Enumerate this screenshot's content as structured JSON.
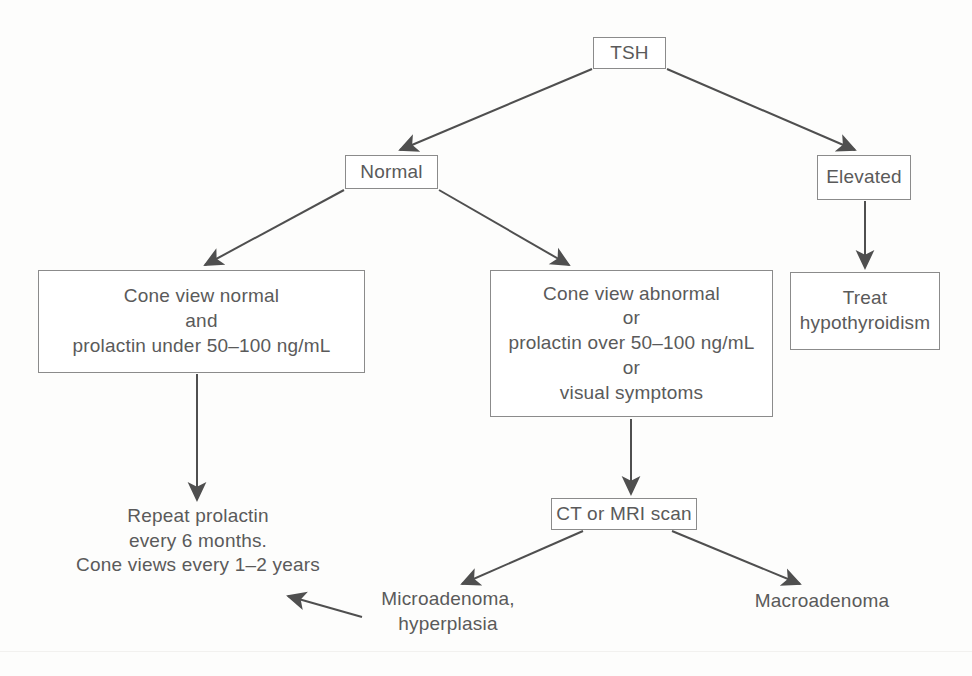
{
  "diagram": {
    "style": {
      "stroke": "#4f4f4f",
      "box_border": "#8b8b8b",
      "text_color": "#5a5a5a",
      "background": "#fdfdfc"
    },
    "nodes": {
      "tsh": {
        "label": "TSH",
        "shape": "box"
      },
      "normal": {
        "label": "Normal",
        "shape": "box"
      },
      "elevated": {
        "label": "Elevated",
        "shape": "box"
      },
      "cone_normal": {
        "shape": "box",
        "lines": [
          "Cone view normal",
          "and",
          "prolactin under 50–100 ng/mL"
        ]
      },
      "cone_abnormal": {
        "shape": "box",
        "lines": [
          "Cone view abnormal",
          "or",
          "prolactin over 50–100 ng/mL",
          "or",
          "visual symptoms"
        ]
      },
      "treat": {
        "shape": "box",
        "lines": [
          "Treat",
          "hypothyroidism"
        ]
      },
      "repeat": {
        "shape": "text",
        "lines": [
          "Repeat prolactin",
          "every 6 months.",
          "Cone views every 1–2 years"
        ]
      },
      "scan": {
        "label": "CT or MRI scan",
        "shape": "box"
      },
      "microadenoma": {
        "shape": "text",
        "lines": [
          "Microadenoma,",
          "hyperplasia"
        ]
      },
      "macroadenoma": {
        "shape": "text",
        "lines": [
          "Macroadenoma"
        ]
      }
    },
    "edges": [
      {
        "from": "tsh",
        "to": "normal",
        "kind": "arrow-diagonal-left"
      },
      {
        "from": "tsh",
        "to": "elevated",
        "kind": "arrow-diagonal-right"
      },
      {
        "from": "normal",
        "to": "cone_normal",
        "kind": "arrow-diagonal-left"
      },
      {
        "from": "normal",
        "to": "cone_abnormal",
        "kind": "arrow-diagonal-right"
      },
      {
        "from": "elevated",
        "to": "treat",
        "kind": "arrow-vertical"
      },
      {
        "from": "cone_normal",
        "to": "repeat",
        "kind": "arrow-vertical"
      },
      {
        "from": "cone_abnormal",
        "to": "scan",
        "kind": "arrow-vertical"
      },
      {
        "from": "scan",
        "to": "microadenoma",
        "kind": "arrow-diagonal-left"
      },
      {
        "from": "scan",
        "to": "macroadenoma",
        "kind": "arrow-diagonal-right"
      },
      {
        "from": "microadenoma",
        "to": "repeat",
        "kind": "arrow-horizontal-left"
      }
    ],
    "page_artifact": {
      "faint_bottom_text": ""
    }
  }
}
